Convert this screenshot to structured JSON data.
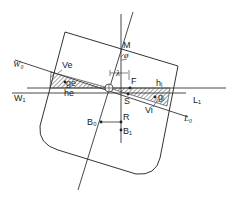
{
  "diagram": {
    "type": "ship-stability-heel-diagram",
    "labels": {
      "M": "M",
      "phi": "ø",
      "lambda": "λ",
      "F": "F",
      "S": "S",
      "W0": "W₀",
      "W1": "W₁",
      "L0": "L₀",
      "L1": "L₁",
      "Ve": "Ve",
      "ge": "ge",
      "he": "he",
      "hi": "hᵢ",
      "gi": "gᵢ",
      "Vi": "Vi",
      "B0": "B₀",
      "R": "R",
      "B1": "B₁"
    },
    "colors": {
      "line": "#333333",
      "hatch": "#444444",
      "background": "#ffffff"
    }
  }
}
